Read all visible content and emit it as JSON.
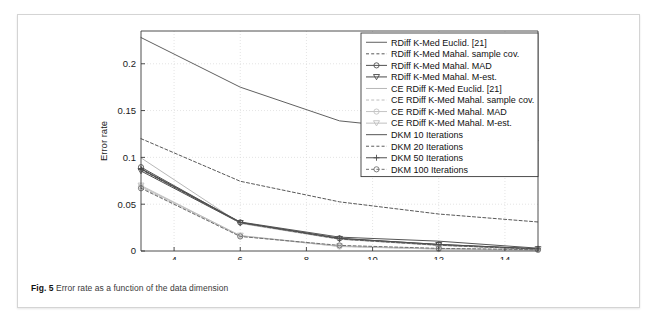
{
  "caption": {
    "label": "Fig. 5",
    "text": "Error rate as a function of the data dimension"
  },
  "chart_data": {
    "type": "line",
    "title": "",
    "xlabel": "Dimension of data",
    "ylabel": "Error rate",
    "xlim": [
      3,
      15
    ],
    "ylim": [
      0,
      0.235
    ],
    "xticks": [
      4,
      6,
      8,
      10,
      12,
      14
    ],
    "xtick_labels": [
      "4",
      "6",
      "8",
      "10",
      "12",
      "14"
    ],
    "yticks": [
      0,
      0.05,
      0.1,
      0.15,
      0.2
    ],
    "ytick_labels": [
      "0",
      "0.05",
      "0.1",
      "0.15",
      "0.2"
    ],
    "grid": true,
    "legend_position": "top-right",
    "x": [
      3,
      6,
      9,
      12,
      15
    ],
    "series": [
      {
        "name": "RDiff K-Med Euclid. [21]",
        "style": "solid",
        "marker": "none",
        "color": "#606060",
        "values": [
          0.228,
          0.175,
          0.139,
          0.128,
          0.118
        ]
      },
      {
        "name": "RDiff K-Med Mahal. sample cov.",
        "style": "dashed",
        "marker": "none",
        "color": "#585858",
        "values": [
          0.12,
          0.0745,
          0.0525,
          0.0395,
          0.031
        ]
      },
      {
        "name": "RDiff K-Med Mahal. MAD",
        "style": "solid",
        "marker": "circle",
        "color": "#505050",
        "values": [
          0.0895,
          0.0305,
          0.0135,
          0.007,
          0.0022
        ]
      },
      {
        "name": "RDiff K-Med Mahal. M-est.",
        "style": "solid",
        "marker": "triangle-down",
        "color": "#4a4a4a",
        "values": [
          0.0855,
          0.03,
          0.013,
          0.0065,
          0.002
        ]
      },
      {
        "name": "CE RDiff K-Med Euclid. [21]",
        "style": "solid",
        "marker": "none",
        "color": "#b8b8b8",
        "values": [
          0.0995,
          0.0295,
          0.0125,
          0.006,
          0.0018
        ]
      },
      {
        "name": "CE RDiff K-Med Mahal. sample cov.",
        "style": "dashed",
        "marker": "none",
        "color": "#bcbcbc",
        "values": [
          0.068,
          0.016,
          0.005,
          0.0022,
          0.0012
        ]
      },
      {
        "name": "CE RDiff K-Med Mahal. MAD",
        "style": "solid",
        "marker": "circle",
        "color": "#c4c4c4",
        "values": [
          0.069,
          0.0162,
          0.0048,
          0.002,
          0.001
        ]
      },
      {
        "name": "CE RDiff K-Med Mahal. M-est.",
        "style": "solid",
        "marker": "triangle-down",
        "color": "#c0c0c0",
        "values": [
          0.07,
          0.0165,
          0.0052,
          0.0024,
          0.0012
        ]
      },
      {
        "name": "DKM 10 Iterations",
        "style": "solid",
        "marker": "none",
        "color": "#555555",
        "values": [
          0.088,
          0.031,
          0.0148,
          0.0105,
          0.003
        ]
      },
      {
        "name": "DKM 20 Iterations",
        "style": "dashed",
        "marker": "none",
        "color": "#5c5c5c",
        "values": [
          0.087,
          0.0302,
          0.0128,
          0.0062,
          0.002
        ]
      },
      {
        "name": "DKM 50 Iterations",
        "style": "solid",
        "marker": "plus",
        "color": "#4e4e4e",
        "values": [
          0.0875,
          0.0305,
          0.0135,
          0.007,
          0.0024
        ]
      },
      {
        "name": "DKM 100 Iterations",
        "style": "dashed",
        "marker": "circle",
        "color": "#707070",
        "values": [
          0.067,
          0.0155,
          0.006,
          0.0028,
          0.0014
        ]
      }
    ]
  }
}
